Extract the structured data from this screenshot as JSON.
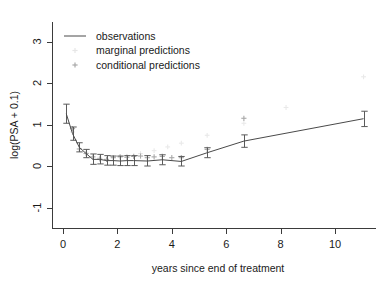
{
  "chart_data": {
    "type": "line",
    "title": "",
    "xlabel": "years since end of treatment",
    "ylabel": "log(PSA + 0.1)",
    "xlim": [
      -0.35,
      11.7
    ],
    "ylim": [
      -1.45,
      3.2
    ],
    "xticks": [
      0,
      2,
      4,
      6,
      8,
      10
    ],
    "yticks": [
      -1,
      0,
      1,
      2,
      3
    ],
    "xtick_labels": [
      "0",
      "2",
      "4",
      "6",
      "8",
      "10"
    ],
    "ytick_labels": [
      "-1",
      "0",
      "1",
      "2",
      "3"
    ],
    "grid": false,
    "legend_position": "top-left",
    "legend": [
      {
        "label": "observations",
        "key": "line",
        "color": "#4a4a4a"
      },
      {
        "label": "marginal predictions",
        "key": "point",
        "color": "#e6e6e6"
      },
      {
        "label": "conditional predictions",
        "key": "point",
        "color": "#a8a8a8"
      }
    ],
    "series": [
      {
        "name": "observations",
        "type": "line-errorbar",
        "color": "#4a4a4a",
        "x": [
          0.12,
          0.35,
          0.6,
          0.85,
          1.1,
          1.35,
          1.6,
          1.85,
          2.1,
          2.35,
          2.6,
          3.1,
          3.65,
          4.35,
          5.3,
          6.65,
          11.05
        ],
        "y": [
          1.26,
          0.78,
          0.45,
          0.3,
          0.16,
          0.16,
          0.13,
          0.13,
          0.12,
          0.13,
          0.13,
          0.12,
          0.15,
          0.11,
          0.32,
          0.6,
          1.14
        ],
        "ylow": [
          1.03,
          0.62,
          0.34,
          0.2,
          0.04,
          0.05,
          0.02,
          0.02,
          0.01,
          0.01,
          0.01,
          0.0,
          0.03,
          0.0,
          0.2,
          0.45,
          0.95
        ],
        "yhigh": [
          1.49,
          0.94,
          0.56,
          0.4,
          0.29,
          0.28,
          0.25,
          0.24,
          0.24,
          0.25,
          0.25,
          0.25,
          0.27,
          0.23,
          0.44,
          0.75,
          1.32
        ]
      },
      {
        "name": "marginal predictions",
        "type": "scatter",
        "color": "#e9e9e9",
        "x": [
          0.35,
          0.85,
          1.35,
          1.85,
          2.35,
          2.85,
          3.35,
          3.85,
          4.35,
          5.3,
          6.65,
          8.2,
          11.05
        ],
        "y": [
          0.82,
          0.33,
          0.21,
          0.21,
          0.24,
          0.3,
          0.37,
          0.46,
          0.55,
          0.74,
          1.03,
          1.41,
          2.15
        ]
      },
      {
        "name": "conditional predictions",
        "type": "scatter",
        "color": "#a8a8a8",
        "x": [
          0.35,
          0.6,
          0.85,
          1.1,
          1.35,
          1.6,
          1.85,
          2.1,
          2.35,
          2.6,
          2.85,
          3.1,
          3.35,
          3.65,
          4.0,
          4.35,
          5.3,
          6.65
        ],
        "y": [
          0.9,
          0.41,
          0.3,
          0.22,
          0.17,
          0.16,
          0.2,
          0.22,
          0.21,
          0.23,
          0.24,
          0.2,
          0.22,
          0.23,
          0.2,
          0.2,
          0.4,
          1.15
        ]
      }
    ]
  }
}
